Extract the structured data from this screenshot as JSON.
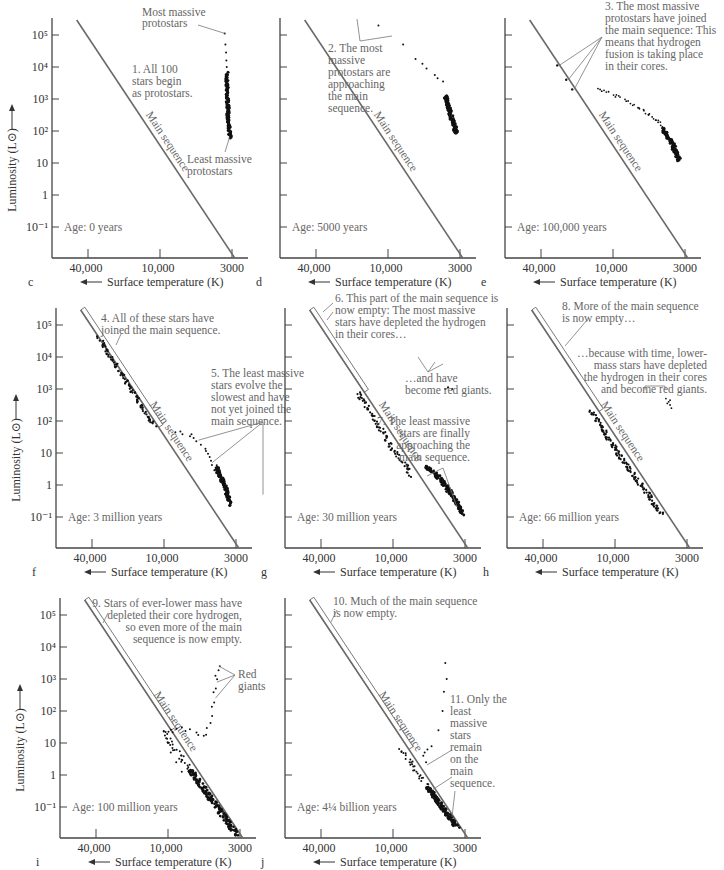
{
  "figure": {
    "xlabel": "Surface temperature (K)",
    "ylabel": "Luminosity (L⊙)",
    "x_arrow_icon": "left-arrow",
    "y_arrow_icon": "up-arrow",
    "main_sequence_label": "Main sequence"
  },
  "chart_data": [
    {
      "type": "scatter",
      "panel": "c",
      "age": "Age: 0 years",
      "title": "",
      "xlabel": "Surface temperature (K)",
      "ylabel": "Luminosity (L⊙)",
      "x_ticks": [
        "40,000",
        "10,000",
        "3000"
      ],
      "y_ticks": [
        "10⁵",
        "10⁴",
        "10³",
        "10²",
        "10",
        "1",
        "10⁻¹"
      ],
      "x_axis": "log temperature, decreasing to the right",
      "ylim_log": [
        -1.5,
        5.3
      ],
      "annotations": [
        "Most massive protostars",
        "1. All 100 stars begin as protostars.",
        "Least massive protostars"
      ],
      "series": [
        {
          "name": "protostars",
          "region": "vertical track near T≈3200–3300 K",
          "logL_range": [
            1.8,
            5.0
          ],
          "count": 100
        }
      ],
      "highlight_box": false
    },
    {
      "type": "scatter",
      "panel": "d",
      "age": "Age: 5000 years",
      "x_ticks": [
        "40,000",
        "10,000",
        "3000"
      ],
      "annotations": [
        "2. The most massive protostars are approaching the main sequence."
      ],
      "series": [
        {
          "name": "protostars",
          "region": "curve from T≈8000 K (logL≈4.4) down to T≈3000 K (logL≈1.9)",
          "count": 100
        }
      ],
      "highlight_box": false
    },
    {
      "type": "scatter",
      "panel": "e",
      "age": "Age: 100,000 years",
      "x_ticks": [
        "40,000",
        "10,000",
        "3000"
      ],
      "annotations": [
        "3. The most massive protostars have joined the main sequence: This means that hydrogen fusion is taking place in their cores."
      ],
      "series": [
        {
          "name": "main-sequence stars",
          "region": "3 stars on main sequence, logL 3.3–4.0"
        },
        {
          "name": "protostars",
          "region": "curve from T≈18,000 K (logL≈3.2) to T≈3300 K (logL≈1.1)"
        }
      ],
      "highlight_box": false
    },
    {
      "type": "scatter",
      "panel": "f",
      "age": "Age: 3 million years",
      "x_ticks": [
        "40,000",
        "10,000",
        "3000"
      ],
      "y_ticks": [
        "10⁵",
        "10⁴",
        "10³",
        "10²",
        "10",
        "1",
        "10⁻¹"
      ],
      "annotations": [
        "4. All of these stars have joined the main sequence.",
        "5. The least massive stars evolve the slowest and have not yet joined the main sequence."
      ],
      "series": [
        {
          "name": "main-sequence stars",
          "region": "along main sequence, logL 1.8–4.6"
        },
        {
          "name": "pre-main-sequence stars",
          "region": "T≈9000–3000 K, logL 1.7 to -0.6"
        }
      ],
      "highlight_box": true
    },
    {
      "type": "scatter",
      "panel": "g",
      "age": "Age: 30 million years",
      "x_ticks": [
        "40,000",
        "10,000",
        "3000"
      ],
      "annotations": [
        "6. This part of the main sequence is now empty: The most massive stars have depleted the hydrogen in their cores…",
        "…and have become red giants.",
        "7. The least massive stars are finally approaching the main sequence."
      ],
      "series": [
        {
          "name": "main-sequence stars",
          "region": "along main sequence, logL -0.9 to 2.9"
        },
        {
          "name": "red giants",
          "region": "3 stars near T≈4500 K, logL≈3.0"
        }
      ],
      "highlight_box": true
    },
    {
      "type": "scatter",
      "panel": "h",
      "age": "Age: 66 million years",
      "x_ticks": [
        "40,000",
        "10,000",
        "3000"
      ],
      "annotations": [
        "8. More of the main sequence is now empty…",
        "…because with time, lower-mass stars have depleted the hydrogen in their cores and become red giants."
      ],
      "series": [
        {
          "name": "main-sequence stars",
          "region": "along main sequence, logL -0.9 to 2.3"
        },
        {
          "name": "red giants",
          "region": "cluster near T≈4300 K, logL≈2.5"
        }
      ],
      "highlight_box": true
    },
    {
      "type": "scatter",
      "panel": "i",
      "age": "Age: 100 million years",
      "x_ticks": [
        "40,000",
        "10,000",
        "3000"
      ],
      "y_ticks": [
        "10⁵",
        "10⁴",
        "10³",
        "10²",
        "10",
        "1",
        "10⁻¹"
      ],
      "annotations": [
        "9. Stars of ever-lower mass have depleted their core hydrogen, so even more of the main sequence is now empty.",
        "Red giants"
      ],
      "series": [
        {
          "name": "main-sequence stars",
          "region": "along main sequence, logL -1.8 to 1.4"
        },
        {
          "name": "evolved stars / red giants",
          "region": "T≈9000–4000 K, logL 1.0–3.4"
        }
      ],
      "highlight_box": true
    },
    {
      "type": "scatter",
      "panel": "j",
      "age": "Age: 4¼ billion years",
      "x_ticks": [
        "40,000",
        "10,000",
        "3000"
      ],
      "annotations": [
        "10. Much of the main sequence is now empty.",
        "11. Only the least massive stars remain on the main sequence."
      ],
      "series": [
        {
          "name": "main-sequence stars",
          "region": "along main sequence, logL -1.2 to 0.8"
        },
        {
          "name": "giants",
          "region": "scattered T≈7000–4000 K, logL 1.0–3.5"
        }
      ],
      "highlight_box": true
    }
  ],
  "panels": [
    {
      "letter": "c",
      "age": "Age: 0 years",
      "notes": [
        "Most massive",
        "protostars",
        "1. All 100",
        "stars begin",
        "as protostars.",
        "Least massive",
        "protostars"
      ]
    },
    {
      "letter": "d",
      "age": "Age: 5000 years",
      "notes": [
        "2. The most",
        "massive",
        "protostars are",
        "approaching",
        "the main",
        "sequence."
      ]
    },
    {
      "letter": "e",
      "age": "Age: 100,000 years",
      "notes": [
        "3. The most massive",
        "protostars have joined",
        "the main sequence: This",
        "means that hydrogen",
        "fusion is taking place",
        "in their cores."
      ]
    },
    {
      "letter": "f",
      "age": "Age: 3 million years",
      "notes": [
        "4. All of these stars have",
        "joined the main sequence.",
        "5. The least massive",
        "stars evolve the",
        "slowest and have",
        "not yet joined the",
        "main sequence."
      ]
    },
    {
      "letter": "g",
      "age": "Age: 30 million years",
      "notes": [
        "6. This part of the main sequence is",
        "now empty: The most massive",
        "stars have depleted the hydrogen",
        "in their cores…",
        "…and have",
        "become red giants.",
        "7. The least massive",
        "stars are finally",
        "approaching the",
        "main sequence."
      ]
    },
    {
      "letter": "h",
      "age": "Age: 66 million years",
      "notes": [
        "8. More of the main sequence",
        "is now empty…",
        "…because with time, lower-",
        "mass stars have depleted",
        "the hydrogen in their cores",
        "and become red giants."
      ]
    },
    {
      "letter": "i",
      "age": "Age: 100 million years",
      "notes": [
        "9. Stars of ever-lower mass have",
        "depleted their core hydrogen,",
        "so even more of the main",
        "sequence is now empty.",
        "Red",
        "giants"
      ]
    },
    {
      "letter": "j",
      "age": "Age: 4¼  billion years",
      "notes": [
        "10. Much of the main sequence",
        "is now empty.",
        "11. Only the",
        "least",
        "massive",
        "stars",
        "remain",
        "on the",
        "main",
        "sequence."
      ]
    }
  ]
}
